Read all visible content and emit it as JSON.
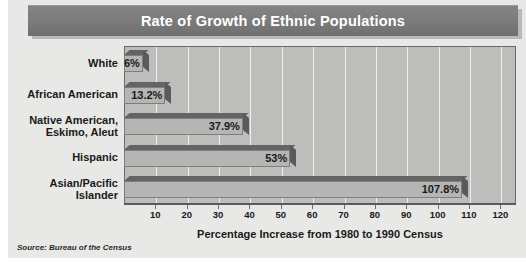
{
  "chart_data": {
    "type": "bar",
    "orientation": "horizontal",
    "title": "Rate of Growth of Ethnic Populations",
    "xlabel": "Percentage Increase from 1980 to 1990 Census",
    "ylabel": "",
    "categories": [
      "White",
      "African American",
      "Native American,\nEskimo, Aleut",
      "Hispanic",
      "Asian/Pacific\nIslander"
    ],
    "values": [
      6,
      13.2,
      37.9,
      53,
      107.8
    ],
    "value_labels": [
      "6%",
      "13.2%",
      "37.9%",
      "53%",
      "107.8%"
    ],
    "xlim": [
      0,
      125
    ],
    "xticks": [
      10,
      20,
      30,
      40,
      50,
      60,
      70,
      80,
      90,
      100,
      110,
      120
    ],
    "xtick_labels": [
      "10",
      "20",
      "30",
      "40",
      "50",
      "60",
      "70",
      "80",
      "90",
      "100",
      "110",
      "120"
    ],
    "grid": true,
    "legend": false,
    "source": "Source: Bureau of the Census",
    "colors": {
      "title_bar": "#7d7d7d",
      "title_text": "#ffffff",
      "plot_background": "#bdbdbb",
      "panel_background": "#e8e8e6",
      "bar_front": "#b5b5b3",
      "bar_top": "#646464",
      "bar_side": "#5a5a5a",
      "gridline": "#efefed",
      "axis": "#5a5a5a",
      "text": "#1a1a1a"
    }
  }
}
